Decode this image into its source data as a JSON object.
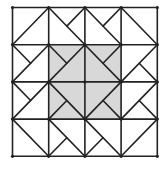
{
  "diagram": {
    "type": "quilt-block-grid",
    "rows": 4,
    "cols": 4,
    "origin": [
      12.5,
      7.5
    ],
    "cell_w": 36.2,
    "cell_h": 37.2,
    "colors": {
      "background": "#ffffff",
      "shade": "#d8d8d8",
      "line": "#222222"
    },
    "shaded_region": {
      "row_start": 1,
      "row_end": 3,
      "col_start": 1,
      "col_end": 3
    },
    "cells": [
      {
        "r": 0,
        "c": 0,
        "diag": "/",
        "half": null
      },
      {
        "r": 0,
        "c": 1,
        "diag": "\\",
        "half": "TR"
      },
      {
        "r": 0,
        "c": 2,
        "diag": "\\",
        "half": "TR"
      },
      {
        "r": 0,
        "c": 3,
        "diag": "\\",
        "half": null
      },
      {
        "r": 1,
        "c": 0,
        "diag": "/",
        "half": "TL"
      },
      {
        "r": 1,
        "c": 1,
        "diag": "/",
        "half": "TL"
      },
      {
        "r": 1,
        "c": 2,
        "diag": "\\",
        "half": "TR"
      },
      {
        "r": 1,
        "c": 3,
        "diag": "/",
        "half": "BR"
      },
      {
        "r": 2,
        "c": 0,
        "diag": "/",
        "half": "TL"
      },
      {
        "r": 2,
        "c": 1,
        "diag": "\\",
        "half": "BL"
      },
      {
        "r": 2,
        "c": 2,
        "diag": "/",
        "half": "BR"
      },
      {
        "r": 2,
        "c": 3,
        "diag": "/",
        "half": "BR"
      },
      {
        "r": 3,
        "c": 0,
        "diag": "\\",
        "half": null
      },
      {
        "r": 3,
        "c": 1,
        "diag": "\\",
        "half": "BL"
      },
      {
        "r": 3,
        "c": 2,
        "diag": "\\",
        "half": "BL"
      },
      {
        "r": 3,
        "c": 3,
        "diag": "/",
        "half": null
      }
    ]
  }
}
